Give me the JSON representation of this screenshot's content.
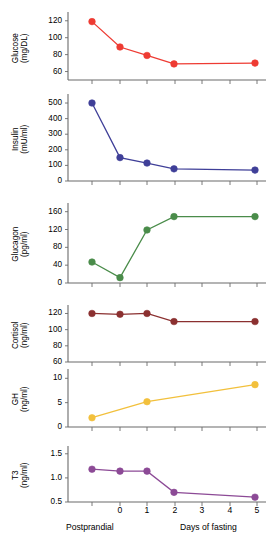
{
  "figure": {
    "xaxis": {
      "label_left": "Postprandial",
      "label_right": "Days of fasting",
      "ticks": [
        "",
        "0",
        "1",
        "2",
        "3",
        "4",
        "5"
      ],
      "tick_values": [
        -0.95,
        0,
        1,
        2,
        3,
        4,
        5
      ]
    }
  },
  "chart_data": [
    {
      "type": "line",
      "name": "glucose",
      "title": "",
      "ylabel": "Glucose\n(mg/DL)",
      "ylabel_line1": "Glucose",
      "ylabel_line2": "(mg/DL)",
      "xlabel": "",
      "color": "#ee3b33",
      "ylim": [
        50,
        128
      ],
      "yticks": [
        60,
        80,
        100,
        120
      ],
      "ytick_labels": [
        "60",
        "80",
        "100",
        "120"
      ],
      "x": [
        -0.95,
        0,
        1,
        2,
        5
      ],
      "values": [
        119,
        89,
        79,
        69,
        70
      ],
      "grid": false
    },
    {
      "type": "line",
      "name": "insulin",
      "ylabel_line1": "Insulin",
      "ylabel_line2": "(mU/ml)",
      "color": "#3f3f98",
      "ylim": [
        0,
        545
      ],
      "yticks": [
        0,
        100,
        200,
        300,
        400,
        500
      ],
      "ytick_labels": [
        "0",
        "100",
        "200",
        "300",
        "400",
        "500"
      ],
      "x": [
        -0.95,
        0,
        1,
        2,
        5
      ],
      "values": [
        500,
        150,
        115,
        78,
        70
      ],
      "grid": false
    },
    {
      "type": "line",
      "name": "glucagon",
      "ylabel_line1": "Glucagon",
      "ylabel_line2": "(pg/ml)",
      "color": "#4a8c4a",
      "ylim": [
        0,
        175
      ],
      "yticks": [
        0,
        40,
        80,
        120,
        160
      ],
      "ytick_labels": [
        "0",
        "40",
        "80",
        "120",
        "160"
      ],
      "x": [
        -0.95,
        0,
        1,
        2,
        5
      ],
      "values": [
        47,
        12,
        119,
        149,
        149
      ],
      "grid": false
    },
    {
      "type": "line",
      "name": "cortisol",
      "ylabel_line1": "Cortisol",
      "ylabel_line2": "(ng/ml)",
      "color": "#8b3030",
      "ylim": [
        60,
        128
      ],
      "yticks": [
        60,
        80,
        100,
        120
      ],
      "ytick_labels": [
        "60",
        "80",
        "100",
        "120"
      ],
      "x": [
        -0.95,
        0,
        1,
        2,
        5
      ],
      "values": [
        120,
        119,
        120,
        110,
        110
      ],
      "grid": false
    },
    {
      "type": "line",
      "name": "gh",
      "ylabel_line1": "GH",
      "ylabel_line2": "(ng/ml)",
      "color": "#f2c03c",
      "ylim": [
        0,
        11.5
      ],
      "yticks": [
        0,
        5,
        10
      ],
      "ytick_labels": [
        "0",
        "5",
        "10"
      ],
      "x": [
        -0.95,
        1,
        5
      ],
      "values": [
        1.9,
        5.2,
        8.7
      ],
      "grid": false
    },
    {
      "type": "line",
      "name": "t3",
      "ylabel_line1": "T3",
      "ylabel_line2": "(ng/ml)",
      "color": "#8c4a96",
      "ylim": [
        0.5,
        1.62
      ],
      "yticks": [
        0.5,
        1.0,
        1.5
      ],
      "ytick_labels": [
        "0.5",
        "1.0",
        "1.5"
      ],
      "x": [
        -0.95,
        0,
        1,
        2,
        5
      ],
      "values": [
        1.18,
        1.14,
        1.14,
        0.7,
        0.6
      ],
      "grid": false
    }
  ]
}
